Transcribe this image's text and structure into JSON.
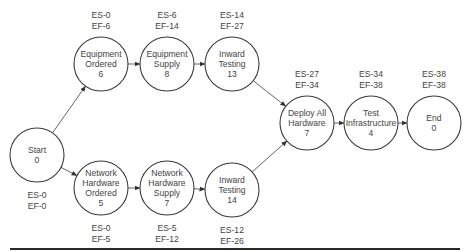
{
  "diagram": {
    "type": "network-diagram (activity-on-node, critical path)",
    "nodes": [
      {
        "id": "start",
        "lines": [
          "Start",
          "0"
        ],
        "duration": 0,
        "es": "ES-0",
        "ef": "EF-0",
        "cx": 37,
        "cy": 155,
        "label_pos": "below"
      },
      {
        "id": "equipment-ordered",
        "lines": [
          "Equipment",
          "Ordered",
          "6"
        ],
        "duration": 6,
        "es": "ES-0",
        "ef": "EF-6",
        "cx": 101,
        "cy": 64,
        "label_pos": "above"
      },
      {
        "id": "equipment-supply",
        "lines": [
          "Equipment",
          "Supply",
          "8"
        ],
        "duration": 8,
        "es": "ES-6",
        "ef": "EF-14",
        "cx": 167,
        "cy": 64,
        "label_pos": "above"
      },
      {
        "id": "inward-testing-13",
        "lines": [
          "Inward",
          "Testing",
          "13"
        ],
        "duration": 13,
        "es": "ES-14",
        "ef": "EF-27",
        "cx": 232,
        "cy": 64,
        "label_pos": "above"
      },
      {
        "id": "network-hardware-ordered",
        "lines": [
          "Network",
          "Hardware",
          "Ordered",
          "5"
        ],
        "duration": 5,
        "es": "ES-0",
        "ef": "EF-5",
        "cx": 101,
        "cy": 188,
        "label_pos": "below"
      },
      {
        "id": "network-hardware-supply",
        "lines": [
          "Network",
          "Hardware",
          "Supply",
          "7"
        ],
        "duration": 7,
        "es": "ES-5",
        "ef": "EF-12",
        "cx": 167,
        "cy": 188,
        "label_pos": "below"
      },
      {
        "id": "inward-testing-14",
        "lines": [
          "Inward",
          "Testing",
          "14"
        ],
        "duration": 14,
        "es": "ES-12",
        "ef": "EF-26",
        "cx": 232,
        "cy": 190,
        "label_pos": "below"
      },
      {
        "id": "deploy-all-hardware",
        "lines": [
          "Deploy All",
          "Hardware",
          "7"
        ],
        "duration": 7,
        "es": "ES-27",
        "ef": "EF-34",
        "cx": 307,
        "cy": 123,
        "label_pos": "above"
      },
      {
        "id": "test-infrastructure",
        "lines": [
          "Test",
          "Infrastructure",
          "4"
        ],
        "duration": 4,
        "es": "ES-34",
        "ef": "EF-38",
        "cx": 371,
        "cy": 123,
        "label_pos": "above"
      },
      {
        "id": "end",
        "lines": [
          "End",
          "0"
        ],
        "duration": 0,
        "es": "ES-38",
        "ef": "EF-38",
        "cx": 434,
        "cy": 123,
        "label_pos": "above"
      }
    ],
    "edges": [
      {
        "from": "start",
        "to": "equipment-ordered"
      },
      {
        "from": "start",
        "to": "network-hardware-ordered"
      },
      {
        "from": "equipment-ordered",
        "to": "equipment-supply"
      },
      {
        "from": "equipment-supply",
        "to": "inward-testing-13"
      },
      {
        "from": "network-hardware-ordered",
        "to": "network-hardware-supply"
      },
      {
        "from": "network-hardware-supply",
        "to": "inward-testing-14"
      },
      {
        "from": "inward-testing-13",
        "to": "deploy-all-hardware"
      },
      {
        "from": "inward-testing-14",
        "to": "deploy-all-hardware"
      },
      {
        "from": "deploy-all-hardware",
        "to": "test-infrastructure"
      },
      {
        "from": "test-infrastructure",
        "to": "end"
      }
    ],
    "node_radius": 27,
    "colors": {
      "stroke": "#3a3a3a",
      "text": "#444444",
      "edge": "#555555",
      "rule": "#2a2a2a"
    }
  }
}
